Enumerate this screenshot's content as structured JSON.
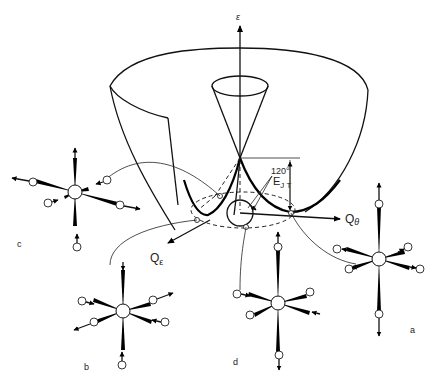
{
  "figure": {
    "axes": {
      "energy": "ε",
      "q_theta": "Q",
      "q_theta_sub": "θ",
      "q_epsilon": "Q",
      "q_epsilon_sub": "ε"
    },
    "annotations": {
      "angle": "120°",
      "ejt_main": "E",
      "ejt_sub": "J T"
    },
    "panels": {
      "a": "a",
      "b": "b",
      "c": "c",
      "d": "d"
    }
  }
}
